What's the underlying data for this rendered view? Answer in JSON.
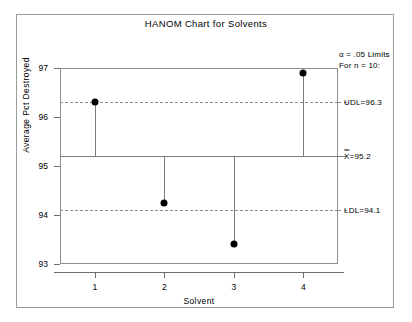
{
  "chart_data": {
    "type": "scatter",
    "title": "HANOM Chart for Solvents",
    "xlabel": "Solvent",
    "ylabel": "Average Pct Destroyed",
    "categories": [
      "1",
      "2",
      "3",
      "4"
    ],
    "values": [
      96.3,
      94.25,
      93.4,
      96.9
    ],
    "series": [
      {
        "name": "Average Pct Destroyed",
        "values": [
          96.3,
          94.25,
          93.4,
          96.9
        ]
      }
    ],
    "ylim": [
      93,
      97
    ],
    "yticks": [
      93,
      94,
      95,
      96,
      97
    ],
    "ytick_labels": [
      "93",
      "94",
      "95",
      "96",
      "97"
    ],
    "xticks": [
      1,
      2,
      3,
      4
    ],
    "xtick_labels": [
      "1",
      "2",
      "3",
      "4"
    ],
    "grid": false,
    "legend_position": "right-outside",
    "reference_lines": [
      {
        "name": "UDL",
        "label": "UDL=96.3",
        "value": 96.3,
        "style": "dashed"
      },
      {
        "name": "center",
        "label": "X=95.2",
        "value": 95.2,
        "style": "solid"
      },
      {
        "name": "LDL",
        "label": "LDL=94.1",
        "value": 94.1,
        "style": "dashed"
      }
    ],
    "annotations": {
      "alpha_line1": "α = .05 Limits",
      "alpha_line2": "For n = 10:"
    },
    "stem_baseline": 95.2
  },
  "labels": {
    "udl": "UDL=96.3",
    "center_value": "=95.2",
    "center_symbol": "X",
    "center_overbars": "═",
    "ldl": "LDL=94.1"
  },
  "colors": {
    "marker": "#000000",
    "line": "#7a7a7a",
    "frame": "#8e8e8e",
    "background": "#ffffff"
  }
}
